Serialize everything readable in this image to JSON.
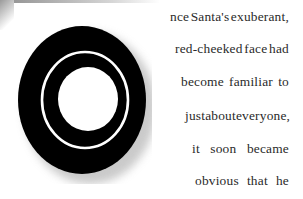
{
  "document": {
    "drop_cap": {
      "letter": "O",
      "style": "concentric black rings with drop shadow",
      "colors": {
        "ring": "#000000",
        "inner": "#ffffff",
        "shadow": "#cccccc"
      }
    },
    "lines": [
      "nce Santa's exuberant,",
      "red-cheeked face had",
      "become familiar to",
      "just about everyone,",
      "it soon became",
      "obvious that he"
    ],
    "text_color": "#2a2a2a"
  }
}
